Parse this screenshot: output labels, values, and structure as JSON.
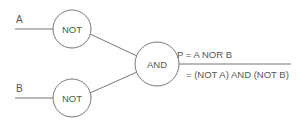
{
  "diagram": {
    "inputs": [
      {
        "label": "A"
      },
      {
        "label": "B"
      }
    ],
    "gates": [
      {
        "id": "not-a",
        "label": "NOT"
      },
      {
        "id": "not-b",
        "label": "NOT"
      },
      {
        "id": "and",
        "label": "AND"
      }
    ],
    "output": {
      "line1": "P = A NOR B",
      "line2": "= (NOT A) AND (NOT B)"
    },
    "colors": {
      "stroke": "#777777",
      "text": "#555555",
      "background": "#ffffff"
    }
  }
}
